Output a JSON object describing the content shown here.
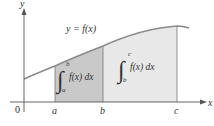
{
  "figure": {
    "curve_label": "y = f(x)",
    "y_axis_label": "y",
    "x_axis_label": "x",
    "origin_label": "0",
    "ticks": [
      {
        "label": "a",
        "x": 55
      },
      {
        "label": "b",
        "x": 103
      },
      {
        "label": "c",
        "x": 177
      }
    ],
    "integral_left": {
      "lower": "a",
      "upper": "b",
      "integrand": "f(x) dx"
    },
    "integral_right": {
      "lower": "b",
      "upper": "c",
      "integrand": "f(x) dx"
    },
    "colors": {
      "region_ab": "#c9c9c9",
      "region_bc": "#e8e8e8",
      "curve": "#8a8a8a",
      "axis": "#555555",
      "text": "#333333"
    }
  }
}
